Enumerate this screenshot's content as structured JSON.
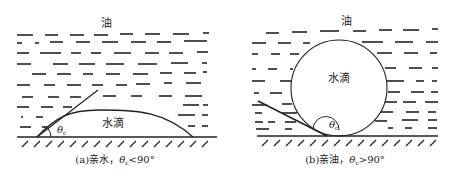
{
  "panel_a": {
    "oil_label": "油",
    "drop_label": "水滴",
    "angle_symbol": "θ",
    "angle_subscript": "c",
    "caption": "(a)亲水，θc<90°",
    "caption_prefix": "(a)亲水，",
    "caption_theta": "θ",
    "caption_sub": "c",
    "caption_suffix": "<90°"
  },
  "panel_b": {
    "oil_label": "油",
    "drop_label": "水滴",
    "angle_symbol": "θ",
    "angle_subscript": "c",
    "caption": "(b)亲油，θc>90°",
    "caption_prefix": "(b)亲油，",
    "caption_theta": "θ",
    "caption_sub": "c",
    "caption_suffix": ">90°"
  },
  "colors": {
    "ink": "#222222",
    "background": "#ffffff"
  }
}
